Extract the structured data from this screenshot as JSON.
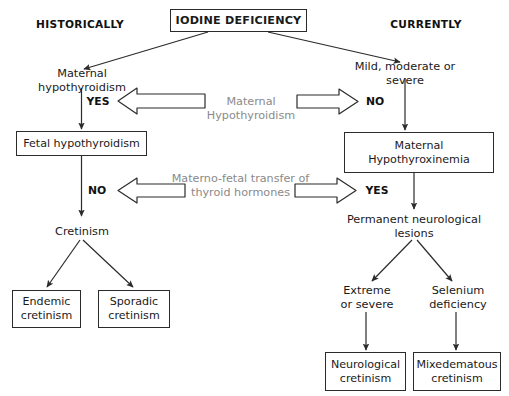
{
  "diagram": {
    "title": "IODINE DEFICIENCY",
    "type": "flowchart",
    "headers": {
      "left": "HISTORICALLY",
      "right": "CURRENTLY"
    },
    "root": {
      "label": "IODINE DEFICIENCY"
    },
    "left_branch": {
      "cause": "Maternal hypothyroidism",
      "decision_1_answer": "YES",
      "node_1": "Fetal hypothyroidism",
      "decision_2_answer": "NO",
      "node_2": "Cretinism",
      "outcomes": [
        "Endemic\ncretinism",
        "Sporadic\ncretinism"
      ],
      "outcome_1_line_1": "Endemic",
      "outcome_1_line_2": "cretinism",
      "outcome_2_line_1": "Sporadic",
      "outcome_2_line_2": "cretinism"
    },
    "right_branch": {
      "cause": "Mild, moderate or severe",
      "decision_1_answer": "NO",
      "node_1_line_1": "Maternal",
      "node_1_line_2": "Hypothyroxinemia",
      "decision_2_answer": "YES",
      "node_2_line_1": "Permanent neurological",
      "node_2_line_2": "lesions",
      "modifier_1_line_1": "Extreme",
      "modifier_1_line_2": "or severe",
      "modifier_2_line_1": "Selenium",
      "modifier_2_line_2": "deficiency",
      "outcome_1_line_1": "Neurological",
      "outcome_1_line_2": "cretinism",
      "outcome_2_line_1": "Mixedematous",
      "outcome_2_line_2": "cretinism"
    },
    "middle_labels": {
      "row_1_line_1": "Maternal",
      "row_1_line_2": "Hypothyroidism",
      "row_2_line_1": "Materno-fetal transfer of",
      "row_2_line_2": "thyroid hormones"
    },
    "colors": {
      "stroke": "#2b2b2b",
      "text": "#1a1a1a",
      "muted_text": "#8a8a8a",
      "background": "#ffffff"
    }
  }
}
